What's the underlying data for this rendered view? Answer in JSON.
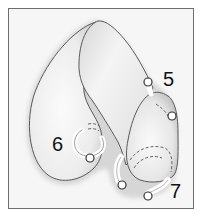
{
  "figure": {
    "labels": [
      {
        "id": "5",
        "text": "5"
      },
      {
        "id": "6",
        "text": "6"
      },
      {
        "id": "7",
        "text": "7"
      }
    ],
    "colors": {
      "frame": "#6e6e6e",
      "background": "#f6f6f6",
      "organ_fill": "#f0f0f0",
      "outline": "#555555",
      "shadow": "#c8c8c8",
      "marker_fill": "#ffffff",
      "marker_stroke": "#333333",
      "label": "#111111"
    }
  }
}
